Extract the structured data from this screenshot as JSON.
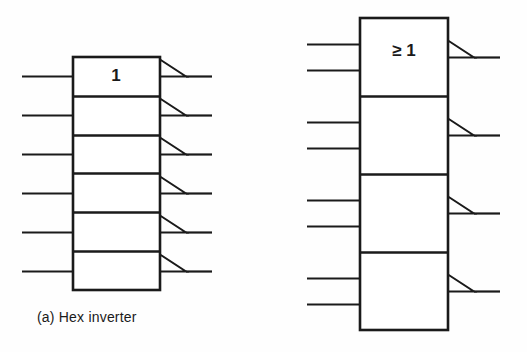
{
  "figure": {
    "background_color": "#fefefe",
    "line_color": "#1a1a1a",
    "symbols": [
      {
        "id": "hex-inverter",
        "caption": "(a)  Hex inverter",
        "caption_label": "(a)",
        "caption_name": "Hex inverter",
        "qualifier": "1",
        "qualifier_meaning": "inverter",
        "sections": 6,
        "inputs_per_section": 1,
        "outputs_per_section": 1,
        "total_inputs": 6,
        "total_outputs": 6,
        "output_inverted": true,
        "geometry": {
          "block_x": 73,
          "block_y": 57,
          "block_w": 87,
          "block_h": 233,
          "section_h": 38.83,
          "input_x_start": 22,
          "output_x_end": 212,
          "tri_w": 26,
          "tri_h": 17,
          "qualifier_x": 116,
          "qualifier_y": 77,
          "caption_x": 37,
          "caption_y": 322
        }
      },
      {
        "id": "quad-or",
        "caption": "",
        "caption_label": "",
        "caption_name": "",
        "qualifier": "≥ 1",
        "qualifier_meaning": "or",
        "sections": 4,
        "inputs_per_section": 2,
        "outputs_per_section": 1,
        "total_inputs": 8,
        "total_outputs": 4,
        "output_inverted": true,
        "geometry": {
          "block_x": 360,
          "block_y": 18,
          "block_w": 88,
          "block_h": 312,
          "section_h": 78,
          "input_x_start": 307,
          "output_x_end": 500,
          "tri_w": 26,
          "tri_h": 17,
          "qualifier_x": 404,
          "qualifier_y": 52,
          "caption_x": 322,
          "caption_y": 350
        }
      }
    ]
  }
}
